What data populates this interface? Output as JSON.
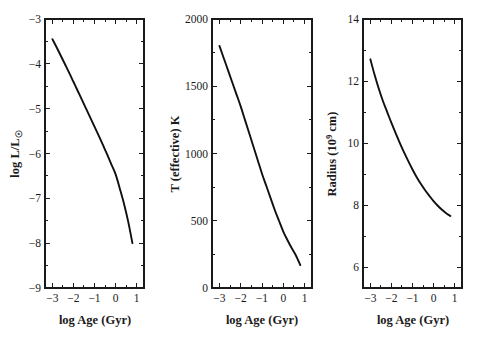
{
  "figure": {
    "background_color": "#ffffff",
    "line_color": "#101010",
    "axis_color": "#1a1a1a",
    "panel_count": 3
  },
  "chart_data": [
    {
      "type": "line",
      "title": "",
      "xlabel": "log Age (Gyr)",
      "ylabel": "log L/L☉",
      "ylabel_parts": {
        "main": "log L/L",
        "subscript": "☉"
      },
      "xlim": [
        -3.35,
        1.35
      ],
      "ylim": [
        -9,
        -3
      ],
      "xticks": [
        -3,
        -2,
        -1,
        0,
        1
      ],
      "xticklabels": [
        "−3",
        "−2",
        "−1",
        "0",
        "1"
      ],
      "yticks": [
        -3,
        -4,
        -5,
        -6,
        -7,
        -8,
        -9
      ],
      "yticklabels": [
        "−3",
        "−4",
        "−5",
        "−6",
        "−7",
        "−8",
        "−9"
      ],
      "minor_xticks": [
        -2.5,
        -1.5,
        -0.5,
        0.5
      ],
      "minor_yticks": [
        -3.5,
        -4.5,
        -5.5,
        -6.5,
        -7.5,
        -8.5
      ],
      "grid": false,
      "legend": null,
      "x": [
        -3.0,
        -2.8,
        -2.6,
        -2.4,
        -2.2,
        -2.0,
        -1.8,
        -1.6,
        -1.4,
        -1.2,
        -1.0,
        -0.8,
        -0.6,
        -0.4,
        -0.2,
        0.0,
        0.2,
        0.4,
        0.6,
        0.8
      ],
      "values": [
        -3.45,
        -3.63,
        -3.82,
        -4.01,
        -4.2,
        -4.4,
        -4.6,
        -4.8,
        -5.0,
        -5.2,
        -5.4,
        -5.6,
        -5.81,
        -6.02,
        -6.24,
        -6.46,
        -6.78,
        -7.12,
        -7.52,
        -8.0
      ]
    },
    {
      "type": "line",
      "title": "",
      "xlabel": "log Age (Gyr)",
      "ylabel": "T (effective) K",
      "xlim": [
        -3.35,
        1.35
      ],
      "ylim": [
        0,
        2000
      ],
      "xticks": [
        -3,
        -2,
        -1,
        0,
        1
      ],
      "xticklabels": [
        "−3",
        "−2",
        "−1",
        "0",
        "1"
      ],
      "yticks": [
        0,
        500,
        1000,
        1500,
        2000
      ],
      "yticklabels": [
        "0",
        "500",
        "1000",
        "1500",
        "2000"
      ],
      "minor_xticks": [
        -2.5,
        -1.5,
        -0.5,
        0.5
      ],
      "minor_yticks": [
        250,
        750,
        1250,
        1750
      ],
      "grid": false,
      "legend": null,
      "x": [
        -3.0,
        -2.8,
        -2.6,
        -2.4,
        -2.2,
        -2.0,
        -1.8,
        -1.6,
        -1.4,
        -1.2,
        -1.0,
        -0.8,
        -0.6,
        -0.4,
        -0.2,
        0.0,
        0.2,
        0.4,
        0.6,
        0.8
      ],
      "values": [
        1800,
        1710,
        1620,
        1530,
        1440,
        1350,
        1250,
        1150,
        1050,
        950,
        850,
        760,
        670,
        580,
        500,
        420,
        355,
        295,
        240,
        170
      ]
    },
    {
      "type": "line",
      "title": "",
      "xlabel": "log Age (Gyr)",
      "ylabel": "Radius (10⁹ cm)",
      "ylabel_parts": {
        "prefix": "Radius (10",
        "superscript": "9",
        "suffix": " cm)"
      },
      "xlim": [
        -3.35,
        1.35
      ],
      "ylim": [
        5.33,
        14
      ],
      "xticks": [
        -3,
        -2,
        -1,
        0,
        1
      ],
      "xticklabels": [
        "−3",
        "−2",
        "−1",
        "0",
        "1"
      ],
      "yticks": [
        6,
        8,
        10,
        12,
        14
      ],
      "yticklabels": [
        "6",
        "8",
        "10",
        "12",
        "14"
      ],
      "minor_xticks": [
        -2.5,
        -1.5,
        -0.5,
        0.5
      ],
      "minor_yticks": [
        7,
        9,
        11,
        13
      ],
      "grid": false,
      "legend": null,
      "x": [
        -3.0,
        -2.8,
        -2.6,
        -2.4,
        -2.2,
        -2.0,
        -1.8,
        -1.6,
        -1.4,
        -1.2,
        -1.0,
        -0.8,
        -0.6,
        -0.4,
        -0.2,
        0.0,
        0.2,
        0.4,
        0.6,
        0.8
      ],
      "values": [
        12.7,
        12.2,
        11.75,
        11.35,
        11.0,
        10.65,
        10.32,
        10.0,
        9.7,
        9.42,
        9.15,
        8.9,
        8.68,
        8.48,
        8.3,
        8.13,
        7.98,
        7.85,
        7.74,
        7.65
      ]
    }
  ]
}
